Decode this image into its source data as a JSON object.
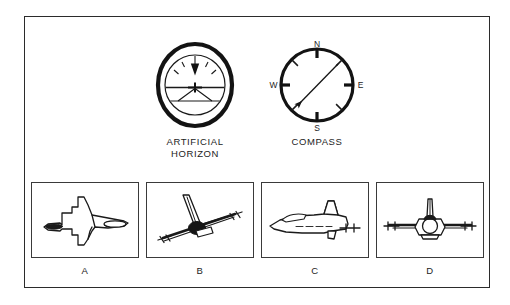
{
  "figure": {
    "kind": "aviation-orientation-test-item",
    "border_color": "#2b2b2b",
    "background": "#ffffff",
    "ink_color": "#1a1a1a"
  },
  "instruments": [
    {
      "id": "artificial-horizon",
      "label": "ARTIFICIAL\nHORIZON",
      "label_line1": "ARTIFICIAL",
      "label_line2": "HORIZON",
      "type": "attitude-indicator",
      "bank_degrees": 0,
      "pitch": "nose-level",
      "reading": "wings level, horizon centered"
    },
    {
      "id": "compass",
      "label": "COMPASS",
      "type": "magnetic-compass",
      "cardinal_marks": [
        "N",
        "E",
        "S",
        "W"
      ],
      "cardinal_n": "N",
      "cardinal_e": "E",
      "cardinal_s": "S",
      "cardinal_w": "W",
      "needle_heading_degrees": 225,
      "needle_direction": "southwest",
      "tick_count": 8
    }
  ],
  "answer_panels": [
    {
      "label": "A",
      "view": "top-plan-view",
      "description": "aircraft seen from above, nose pointing left"
    },
    {
      "label": "B",
      "view": "rear-view-banked",
      "description": "aircraft seen from behind, banked with right wing low"
    },
    {
      "label": "C",
      "view": "side-profile-view",
      "description": "aircraft seen from the side, nose pointing left"
    },
    {
      "label": "D",
      "view": "front-view-level",
      "description": "aircraft seen head on, wings level"
    }
  ]
}
